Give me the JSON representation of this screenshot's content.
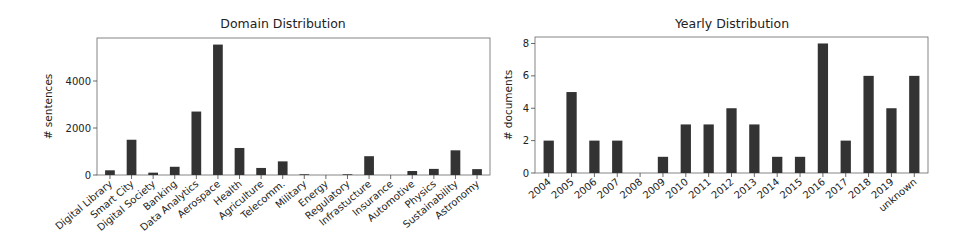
{
  "chart_data": [
    {
      "type": "bar",
      "title": "Domain Distribution",
      "xlabel": "",
      "ylabel": "# sentences",
      "ylim": [
        0,
        5830
      ],
      "yticks": [
        0,
        2000,
        4000
      ],
      "grid": false,
      "bar_color": "#333333",
      "categories": [
        "Digital Library",
        "Smart City",
        "Digital Society",
        "Banking",
        "Data Analytics",
        "Aerospace",
        "Health",
        "Agriculture",
        "Telecomm.",
        "Military",
        "Energy",
        "Regulatory",
        "Infrastucture",
        "Insurance",
        "Automotive",
        "Physics",
        "Sustainability",
        "Astronomy"
      ],
      "values": [
        200,
        1500,
        100,
        350,
        2700,
        5550,
        1150,
        300,
        580,
        30,
        0,
        30,
        800,
        0,
        170,
        260,
        1050,
        250
      ]
    },
    {
      "type": "bar",
      "title": "Yearly Distribution",
      "xlabel": "",
      "ylabel": "# documents",
      "ylim": [
        0,
        8.4
      ],
      "yticks": [
        0,
        2,
        4,
        6,
        8
      ],
      "grid": false,
      "bar_color": "#333333",
      "categories": [
        "2004",
        "2005",
        "2006",
        "2007",
        "2008",
        "2009",
        "2010",
        "2011",
        "2012",
        "2013",
        "2014",
        "2015",
        "2016",
        "2017",
        "2018",
        "2019",
        "unknown"
      ],
      "values": [
        2,
        5,
        2,
        2,
        0,
        1,
        3,
        3,
        4,
        3,
        1,
        1,
        8,
        2,
        6,
        4,
        6
      ]
    }
  ]
}
